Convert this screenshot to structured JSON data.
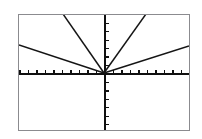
{
  "screen": {
    "title": "Graphing Calculator Screen",
    "device": "graphing-calculator",
    "background_color": "#ffffff",
    "border_color": "#8b8b8f",
    "ink_color": "#151515"
  },
  "viewport": {
    "frame_left": 18,
    "frame_top": 14,
    "frame_width": 172,
    "frame_height": 117,
    "origin_x": 86,
    "origin_y": 59
  },
  "chart_data": {
    "type": "line",
    "title": "",
    "xlabel": "",
    "ylabel": "",
    "grid": false,
    "legend": "none",
    "xlim": [
      -10,
      10
    ],
    "ylim": [
      -6.8,
      6.8
    ],
    "x_tick_step": 1,
    "y_tick_step": 1,
    "x_tick_count": 20,
    "y_tick_count": 13,
    "axes_visible": true,
    "series": [
      {
        "name": "steep-left",
        "slope": -4,
        "quadrant": "II",
        "x": [
          -2.1,
          0
        ],
        "y": [
          6.8,
          0
        ],
        "px_start_x": 63,
        "px_start_y": 14,
        "px_end_x": 104,
        "px_end_y": 73
      },
      {
        "name": "shallow-left",
        "slope": -0.6,
        "quadrant": "II",
        "x": [
          -10,
          0
        ],
        "y": [
          3.3,
          0
        ],
        "px_start_x": 19,
        "px_start_y": 45,
        "px_end_x": 104,
        "px_end_y": 73
      },
      {
        "name": "steep-right",
        "slope": 3.2,
        "quadrant": "I",
        "x": [
          0,
          2.4
        ],
        "y": [
          0,
          6.8
        ],
        "px_start_x": 104,
        "px_start_y": 73,
        "px_end_x": 146,
        "px_end_y": 14
      },
      {
        "name": "shallow-right",
        "slope": 0.62,
        "quadrant": "I",
        "x": [
          0,
          10
        ],
        "y": [
          0,
          3.1
        ],
        "px_start_x": 104,
        "px_start_y": 73,
        "px_end_x": 189,
        "px_end_y": 46
      }
    ]
  }
}
